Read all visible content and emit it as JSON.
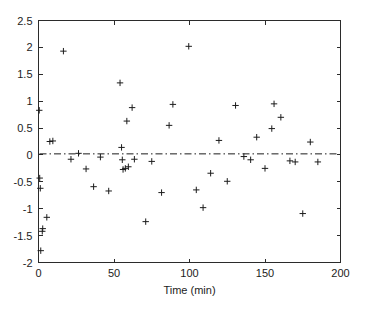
{
  "chart_data": {
    "type": "scatter",
    "title": "",
    "subtitle": "",
    "xlabel": "Time (min)",
    "ylabel": "",
    "xlim": [
      0,
      200
    ],
    "ylim": [
      -2,
      2.5
    ],
    "xticks": [
      0,
      50,
      100,
      150,
      200
    ],
    "xticklabels": [
      "0",
      "50",
      "100",
      "150",
      "200"
    ],
    "yticks": [
      -2,
      -1.5,
      -1,
      -0.5,
      0,
      0.5,
      1,
      1.5,
      2,
      2.5
    ],
    "yticklabels": [
      "-2",
      "-1.5",
      "-1",
      "-0.5",
      "0",
      "0.5",
      "1",
      "1.5",
      "2",
      "2.5"
    ],
    "grid": false,
    "legend": null,
    "marker": "plus",
    "marker_color": "#1c1c1c",
    "box": true,
    "tick_direction": "in",
    "annotations": [
      {
        "name": "zero-reference-line",
        "type": "horizontal-line",
        "y": 0.02,
        "style": "dash-dot",
        "color": "#1c1c1c"
      }
    ],
    "series": [
      {
        "name": "residuals",
        "points": [
          [
            0.5,
            0.83
          ],
          [
            0.8,
            -0.43
          ],
          [
            1.2,
            -0.62
          ],
          [
            1.5,
            -1.78
          ],
          [
            2.5,
            -1.42
          ],
          [
            2.8,
            -1.37
          ],
          [
            5.5,
            -1.16
          ],
          [
            7.5,
            0.25
          ],
          [
            9.5,
            0.26
          ],
          [
            16.5,
            1.93
          ],
          [
            21.5,
            -0.08
          ],
          [
            26.5,
            0.03
          ],
          [
            31.5,
            -0.26
          ],
          [
            36.5,
            -0.59
          ],
          [
            41.0,
            -0.04
          ],
          [
            46.5,
            -0.67
          ],
          [
            54.0,
            1.34
          ],
          [
            55.0,
            0.14
          ],
          [
            55.5,
            -0.09
          ],
          [
            56.0,
            -0.27
          ],
          [
            57.5,
            -0.25
          ],
          [
            58.5,
            0.63
          ],
          [
            59.5,
            -0.22
          ],
          [
            62.0,
            0.88
          ],
          [
            63.5,
            -0.08
          ],
          [
            71.0,
            -1.24
          ],
          [
            75.0,
            -0.12
          ],
          [
            81.5,
            -0.7
          ],
          [
            86.5,
            0.55
          ],
          [
            89.0,
            0.94
          ],
          [
            99.5,
            2.02
          ],
          [
            104.5,
            -0.65
          ],
          [
            109.0,
            -0.98
          ],
          [
            114.0,
            -0.34
          ],
          [
            119.5,
            0.27
          ],
          [
            125.0,
            -0.49
          ],
          [
            130.5,
            0.92
          ],
          [
            136.0,
            -0.03
          ],
          [
            140.5,
            -0.09
          ],
          [
            144.5,
            0.33
          ],
          [
            150.0,
            -0.25
          ],
          [
            154.5,
            0.49
          ],
          [
            156.0,
            0.95
          ],
          [
            160.5,
            0.7
          ],
          [
            166.5,
            -0.11
          ],
          [
            170.0,
            -0.13
          ],
          [
            175.0,
            -1.09
          ],
          [
            180.0,
            0.24
          ],
          [
            185.0,
            -0.13
          ]
        ]
      }
    ]
  },
  "figure": {
    "background_color": "#ffffff",
    "axis_color": "#2b2b2b"
  }
}
